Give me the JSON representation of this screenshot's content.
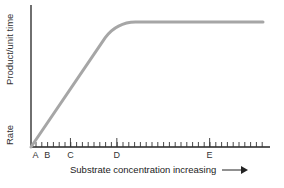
{
  "chart_data": {
    "type": "line",
    "title": "",
    "xlabel": "Substrate concentration increasing",
    "ylabel": "Rate   Product/unit time",
    "ylabel_parts": [
      "Rate",
      "Product/unit time"
    ],
    "x_tick_labels": [
      "A",
      "B",
      "C",
      "D",
      "E"
    ],
    "x_tick_positions_rel": [
      0.02,
      0.07,
      0.17,
      0.37,
      0.77
    ],
    "series": [
      {
        "name": "Reaction rate",
        "description": "Linear increase from origin, curving into plateau (saturation) past D",
        "points": [
          [
            0,
            0
          ],
          [
            0.2,
            0.27
          ],
          [
            0.32,
            0.77
          ],
          [
            0.37,
            0.85
          ],
          [
            0.45,
            0.88
          ],
          [
            1.0,
            0.88
          ]
        ]
      }
    ],
    "xlim": [
      0,
      1
    ],
    "ylim": [
      0,
      1
    ],
    "grid": false,
    "legend": null,
    "line_color": "#a6a6a6",
    "axis_color": "#222222"
  }
}
